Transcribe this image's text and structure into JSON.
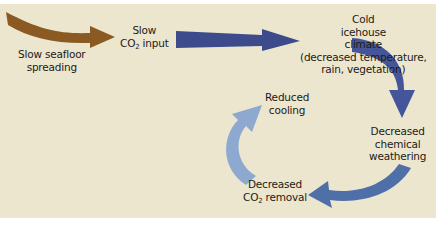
{
  "diagram": {
    "colors": {
      "background": "#ece6cf",
      "brown_arrow": "#8a5a22",
      "dark_blue_arrow": "#3d4a8c",
      "mid_blue_arrow": "#4f6fa8",
      "light_blue_arrow": "#8ea9d0",
      "text": "#1e1a16"
    },
    "nodes": {
      "seafloor": {
        "line1": "Slow seafloor",
        "line2": "spreading"
      },
      "co2_input": {
        "line1": "Slow",
        "co2_prefix": "CO",
        "co2_sub": "2",
        "co2_suffix": " input"
      },
      "icehouse": {
        "line1": "Cold",
        "line2": "icehouse",
        "line3": "climate",
        "line4": "(decreased temperature,",
        "line5": "rain, vegetation)"
      },
      "weathering": {
        "line1": "Decreased",
        "line2": "chemical",
        "line3": "weathering"
      },
      "co2_removal": {
        "line1": "Decreased",
        "co2_prefix": "CO",
        "co2_sub": "2",
        "co2_suffix": " removal"
      },
      "reduced_cooling": {
        "line1": "Reduced",
        "line2": "cooling"
      }
    },
    "arrows": [
      {
        "from": "seafloor",
        "to": "co2_input",
        "color": "brown"
      },
      {
        "from": "co2_input",
        "to": "icehouse",
        "color": "dark-blue"
      },
      {
        "from": "icehouse",
        "to": "weathering",
        "color": "dark-blue"
      },
      {
        "from": "weathering",
        "to": "co2_removal",
        "color": "mid-blue"
      },
      {
        "from": "co2_removal",
        "to": "reduced_cooling",
        "color": "light-blue"
      }
    ]
  }
}
